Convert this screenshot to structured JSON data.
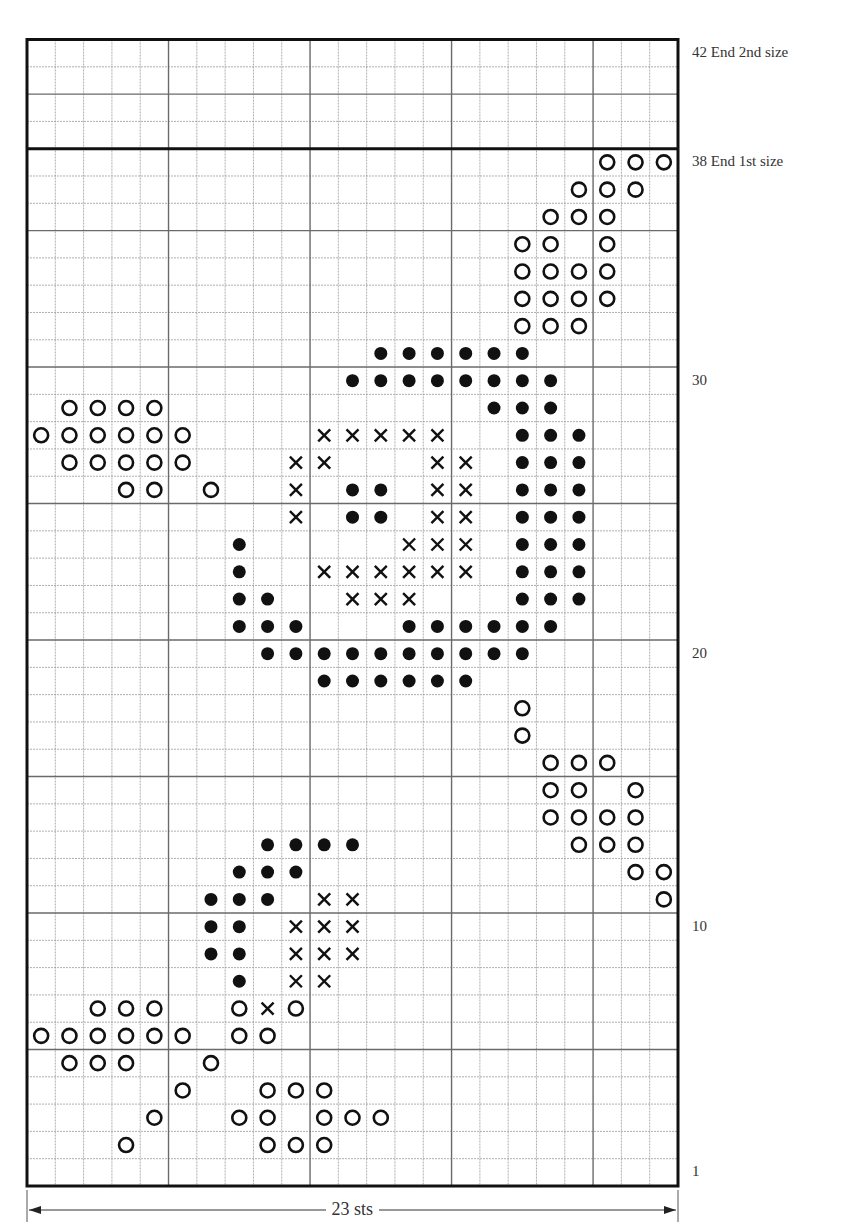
{
  "chart": {
    "columns": 23,
    "rows": 42,
    "grid": {
      "left": 27,
      "top": 39.5,
      "right": 678,
      "bottom": 1186
    },
    "major_every": 5,
    "size_break_row": 38,
    "colors": {
      "ink": "#111111",
      "minor": "#9a9a9a",
      "major": "#6a6a6a",
      "border": "#111111"
    },
    "symbols": {
      "O": "open-circle",
      "D": "filled-dot",
      "X": "cross"
    },
    "cells": [
      {
        "row": 2,
        "O": [
          4,
          9,
          10,
          11
        ]
      },
      {
        "row": 3,
        "O": [
          5,
          8,
          9,
          11,
          12,
          13
        ]
      },
      {
        "row": 4,
        "O": [
          6,
          9,
          10,
          11
        ]
      },
      {
        "row": 5,
        "O": [
          2,
          3,
          4,
          7
        ]
      },
      {
        "row": 6,
        "O": [
          1,
          2,
          3,
          4,
          5,
          6,
          8,
          9
        ]
      },
      {
        "row": 7,
        "O": [
          3,
          4,
          5,
          8,
          10
        ],
        "X": [
          9
        ]
      },
      {
        "row": 8,
        "D": [
          8
        ],
        "X": [
          10,
          11
        ]
      },
      {
        "row": 9,
        "D": [
          7,
          8
        ],
        "X": [
          10,
          11,
          12
        ]
      },
      {
        "row": 10,
        "D": [
          7,
          8
        ],
        "X": [
          10,
          11,
          12
        ]
      },
      {
        "row": 11,
        "D": [
          7,
          8,
          9
        ],
        "X": [
          11,
          12
        ],
        "O": [
          23
        ]
      },
      {
        "row": 12,
        "D": [
          8,
          9,
          10
        ],
        "O": [
          22,
          23
        ]
      },
      {
        "row": 13,
        "D": [
          9,
          10,
          11,
          12
        ],
        "O": [
          20,
          21,
          22
        ]
      },
      {
        "row": 14,
        "O": [
          19,
          20,
          21,
          22
        ]
      },
      {
        "row": 15,
        "O": [
          19,
          20,
          22
        ]
      },
      {
        "row": 16,
        "O": [
          19,
          20,
          21
        ]
      },
      {
        "row": 17,
        "O": [
          18
        ]
      },
      {
        "row": 18,
        "O": [
          18
        ]
      },
      {
        "row": 19,
        "D": [
          11,
          12,
          13,
          14,
          15,
          16
        ]
      },
      {
        "row": 20,
        "D": [
          9,
          10,
          11,
          12,
          13,
          14,
          15,
          16,
          17,
          18
        ]
      },
      {
        "row": 21,
        "D": [
          8,
          9,
          10,
          14,
          15,
          16,
          17,
          18,
          19
        ]
      },
      {
        "row": 22,
        "D": [
          8,
          9,
          18,
          19,
          20
        ],
        "X": [
          12,
          13,
          14
        ]
      },
      {
        "row": 23,
        "D": [
          8,
          18,
          19,
          20
        ],
        "X": [
          11,
          12,
          13,
          14,
          15,
          16
        ]
      },
      {
        "row": 24,
        "D": [
          8,
          18,
          19,
          20
        ],
        "X": [
          14,
          15,
          16
        ]
      },
      {
        "row": 25,
        "D": [
          12,
          13,
          18,
          19,
          20
        ],
        "X": [
          10,
          15,
          16
        ]
      },
      {
        "row": 26,
        "O": [
          4,
          5,
          7
        ],
        "D": [
          12,
          13,
          18,
          19,
          20
        ],
        "X": [
          10,
          15,
          16
        ]
      },
      {
        "row": 27,
        "O": [
          2,
          3,
          4,
          5,
          6
        ],
        "X": [
          10,
          11,
          15,
          16
        ],
        "D": [
          18,
          19,
          20
        ]
      },
      {
        "row": 28,
        "O": [
          1,
          2,
          3,
          4,
          5,
          6
        ],
        "X": [
          11,
          12,
          13,
          14,
          15
        ],
        "D": [
          18,
          19,
          20
        ]
      },
      {
        "row": 29,
        "O": [
          2,
          3,
          4,
          5
        ],
        "D": [
          17,
          18,
          19
        ]
      },
      {
        "row": 30,
        "D": [
          12,
          13,
          14,
          15,
          16,
          17,
          18,
          19
        ]
      },
      {
        "row": 31,
        "D": [
          13,
          14,
          15,
          16,
          17,
          18
        ]
      },
      {
        "row": 32,
        "O": [
          18,
          19,
          20
        ]
      },
      {
        "row": 33,
        "O": [
          18,
          19,
          20,
          21
        ]
      },
      {
        "row": 34,
        "O": [
          18,
          19,
          20,
          21
        ]
      },
      {
        "row": 35,
        "O": [
          18,
          19,
          21
        ]
      },
      {
        "row": 36,
        "O": [
          19,
          20,
          21
        ]
      },
      {
        "row": 37,
        "O": [
          20,
          21,
          22
        ]
      },
      {
        "row": 38,
        "O": [
          21,
          22,
          23
        ]
      }
    ]
  },
  "labels": {
    "rows": [
      {
        "row": 42,
        "text": "42 End 2nd size"
      },
      {
        "row": 38,
        "text": "38 End 1st size"
      },
      {
        "row": 30,
        "text": "30"
      },
      {
        "row": 20,
        "text": "20"
      },
      {
        "row": 10,
        "text": "10"
      },
      {
        "row": 1,
        "text": "1"
      }
    ],
    "width": "23 sts"
  }
}
